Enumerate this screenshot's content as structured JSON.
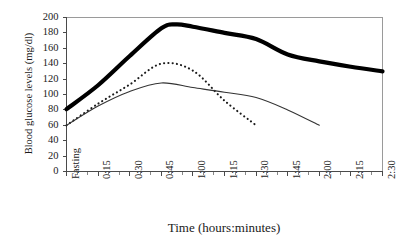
{
  "chart_data": {
    "type": "line",
    "title": "",
    "xlabel": "Time (hours:minutes)",
    "ylabel": "Blood glucose levels (mg/dl)",
    "categories": [
      "Fasting",
      "0:15",
      "0:30",
      "0:45",
      "1:00",
      "1:15",
      "1:30",
      "1:45",
      "2:00",
      "2:15",
      "2:30"
    ],
    "ylim": [
      0,
      200
    ],
    "ytick_labels": [
      "200",
      "180",
      "160",
      "140",
      "120",
      "100",
      "80",
      "60",
      "40",
      "20",
      "0"
    ],
    "ytick_values": [
      200,
      180,
      160,
      140,
      120,
      100,
      80,
      60,
      40,
      20,
      0
    ],
    "ytick_interval": 20,
    "grid": false,
    "legend": "none",
    "minor_ticks_per_interval": 2,
    "series": [
      {
        "name": "bold-curve",
        "style": "solid-thick",
        "color": "#000000",
        "width": 4.2,
        "x": [
          "Fasting",
          "0:15",
          "0:30",
          "0:45",
          "0:52",
          "1:00",
          "1:15",
          "1:30",
          "1:45",
          "2:00",
          "2:15",
          "2:30"
        ],
        "values": [
          81,
          112,
          150,
          186,
          191,
          188,
          180,
          172,
          152,
          143,
          136,
          130
        ]
      },
      {
        "name": "dotted-curve",
        "style": "dotted",
        "color": "#1a1a1a",
        "width": 2.1,
        "x": [
          "Fasting",
          "0:15",
          "0:30",
          "0:45",
          "1:00",
          "1:15",
          "1:30"
        ],
        "values": [
          60,
          88,
          113,
          140,
          131,
          92,
          60
        ]
      },
      {
        "name": "thin-curve",
        "style": "solid-thin",
        "color": "#333333",
        "width": 1.1,
        "x": [
          "Fasting",
          "0:15",
          "0:30",
          "0:45",
          "1:00",
          "1:15",
          "1:30",
          "1:45",
          "2:00"
        ],
        "values": [
          60,
          85,
          104,
          115,
          109,
          103,
          96,
          80,
          60
        ]
      }
    ]
  },
  "axis": {
    "y_title": "Blood glucose levels (mg/dl)",
    "x_title": "Time (hours:minutes)"
  }
}
